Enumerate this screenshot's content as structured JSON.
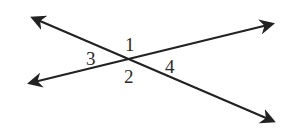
{
  "diagram": {
    "type": "intersecting-lines",
    "line_color": "#222222",
    "lines": [
      {
        "name": "line-a",
        "from": [
          33,
          18
        ],
        "to": [
          273,
          121
        ]
      },
      {
        "name": "line-b",
        "from": [
          30,
          83
        ],
        "to": [
          272,
          24
        ]
      }
    ],
    "intersection": [
      130,
      60
    ],
    "angle_labels": [
      {
        "text": "1",
        "x": 125,
        "y": 51
      },
      {
        "text": "2",
        "x": 124,
        "y": 83
      },
      {
        "text": "3",
        "x": 86,
        "y": 65
      },
      {
        "text": "4",
        "x": 165,
        "y": 73
      }
    ]
  }
}
